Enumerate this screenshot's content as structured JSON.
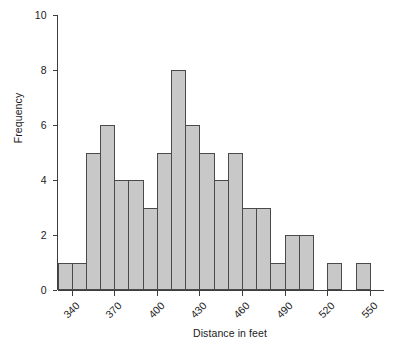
{
  "chart_data": {
    "type": "bar",
    "title": "",
    "xlabel": "Distance in feet",
    "ylabel": "Frequency",
    "bin_width": 10,
    "x_start": 330,
    "x_end": 560,
    "xlim": [
      330,
      560
    ],
    "ylim": [
      0,
      10
    ],
    "grid": false,
    "legend": null,
    "xtick_labels": [
      "340",
      "370",
      "400",
      "430",
      "460",
      "490",
      "520",
      "550"
    ],
    "xtick_values": [
      340,
      370,
      400,
      430,
      460,
      490,
      520,
      550
    ],
    "ytick_labels": [
      "0",
      "2",
      "4",
      "6",
      "8",
      "10"
    ],
    "ytick_values": [
      0,
      2,
      4,
      6,
      8,
      10
    ],
    "categories": [
      "330-340",
      "340-350",
      "350-360",
      "360-370",
      "370-380",
      "380-390",
      "390-400",
      "400-410",
      "410-420",
      "420-430",
      "430-440",
      "440-450",
      "450-460",
      "460-470",
      "470-480",
      "480-490",
      "490-500",
      "500-510",
      "510-520",
      "520-530",
      "530-540",
      "540-550"
    ],
    "bin_starts": [
      330,
      340,
      350,
      360,
      370,
      380,
      390,
      400,
      410,
      420,
      430,
      440,
      450,
      460,
      470,
      480,
      490,
      500,
      510,
      520,
      530,
      540
    ],
    "values": [
      1,
      1,
      5,
      6,
      4,
      4,
      3,
      5,
      8,
      6,
      5,
      4,
      5,
      3,
      3,
      1,
      2,
      2,
      0,
      1,
      0,
      1
    ],
    "bar_fill_color": "#c8c8c8",
    "bar_edge_color": "#4a4a4a",
    "axis_color": "#3d3d3d"
  }
}
